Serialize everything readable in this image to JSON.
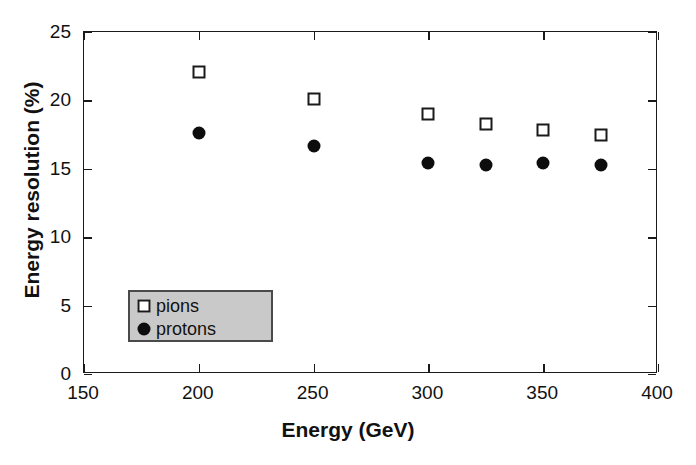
{
  "chart_data": {
    "type": "scatter",
    "title": "",
    "xlabel": "Energy (GeV)",
    "ylabel": "Energy resolution (%)",
    "xlim": [
      150,
      400
    ],
    "ylim": [
      0,
      25
    ],
    "xticks": [
      150,
      200,
      250,
      300,
      350,
      400
    ],
    "yticks": [
      0,
      5,
      10,
      15,
      20,
      25
    ],
    "grid": false,
    "legend_position": "lower left",
    "series": [
      {
        "name": "pions",
        "marker": "open-square",
        "x": [
          200,
          250,
          300,
          325,
          350,
          375
        ],
        "values": [
          22.1,
          20.1,
          19.0,
          18.3,
          17.8,
          17.5
        ]
      },
      {
        "name": "protons",
        "marker": "filled-circle",
        "x": [
          200,
          250,
          300,
          325,
          350,
          375
        ],
        "values": [
          17.6,
          16.7,
          15.4,
          15.3,
          15.4,
          15.25
        ]
      }
    ],
    "colors": {
      "axis": "#1a1a1a",
      "marker_fill": "#0d0d0d",
      "marker_open_fill": "#ffffff",
      "legend_background": "#c9c9c9",
      "legend_border": "#4a4a4a",
      "background": "#ffffff"
    }
  }
}
